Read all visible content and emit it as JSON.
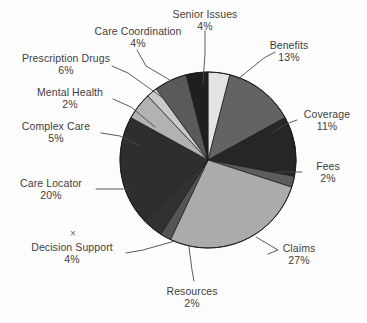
{
  "chart_data": {
    "type": "pie",
    "title": "",
    "subtitle": "",
    "xlabel": "",
    "ylabel": "",
    "legend_position": "none",
    "grid": false,
    "value_suffix": "%",
    "categories": [
      "Senior Issues",
      "Benefits",
      "Coverage",
      "Fees",
      "Claims",
      "Resources",
      "Decision Support",
      "Care Locator",
      "Complex Care",
      "Mental Health",
      "Prescription Drugs",
      "Care Coordination"
    ],
    "values": [
      4,
      13,
      11,
      2,
      27,
      2,
      4,
      20,
      5,
      2,
      6,
      4
    ],
    "slices": [
      {
        "label": "Senior Issues",
        "value": 4,
        "pct_text": "4%",
        "color": "#e4e4e4"
      },
      {
        "label": "Benefits",
        "value": 13,
        "pct_text": "13%",
        "color": "#636363"
      },
      {
        "label": "Coverage",
        "value": 11,
        "pct_text": "11%",
        "color": "#262626"
      },
      {
        "label": "Fees",
        "value": 2,
        "pct_text": "2%",
        "color": "#5c5c5c"
      },
      {
        "label": "Claims",
        "value": 27,
        "pct_text": "27%",
        "color": "#ababab"
      },
      {
        "label": "Resources",
        "value": 2,
        "pct_text": "2%",
        "color": "#555555"
      },
      {
        "label": "Decision Support",
        "value": 4,
        "pct_text": "4%",
        "color": "#313131"
      },
      {
        "label": "Care Locator",
        "value": 20,
        "pct_text": "20%",
        "color": "#2e2e2e"
      },
      {
        "label": "Complex Care",
        "value": 5,
        "pct_text": "5%",
        "color": "#b2b2b2"
      },
      {
        "label": "Mental Health",
        "value": 2,
        "pct_text": "2%",
        "color": "#c9c9c9"
      },
      {
        "label": "Prescription Drugs",
        "value": 6,
        "pct_text": "6%",
        "color": "#5a5a5a"
      },
      {
        "label": "Care Coordination",
        "value": 4,
        "pct_text": "4%",
        "color": "#1f1f1f"
      }
    ]
  },
  "labels": {
    "senior_issues": {
      "name": "Senior Issues",
      "pct": "4%"
    },
    "care_coordination": {
      "name": "Care Coordination",
      "pct": "4%"
    },
    "benefits": {
      "name": "Benefits",
      "pct": "13%"
    },
    "prescription_drugs": {
      "name": "Prescription Drugs",
      "pct": "6%"
    },
    "mental_health": {
      "name": "Mental Health",
      "pct": "2%"
    },
    "coverage": {
      "name": "Coverage",
      "pct": "11%"
    },
    "complex_care": {
      "name": "Complex Care",
      "pct": "5%"
    },
    "fees": {
      "name": "Fees",
      "pct": "2%"
    },
    "care_locator": {
      "name": "Care Locator",
      "pct": "20%"
    },
    "claims": {
      "name": "Claims",
      "pct": "27%"
    },
    "decision_support": {
      "name": "Decision Support",
      "pct": "4%"
    },
    "resources": {
      "name": "Resources",
      "pct": "2%"
    }
  },
  "marks": {
    "stray_x": "×"
  },
  "style": {
    "background": "#fdfdfd",
    "text_color": "#3d3d3d",
    "leader_color": "#4a4a4a",
    "slice_outline": "#1a1a1a"
  }
}
